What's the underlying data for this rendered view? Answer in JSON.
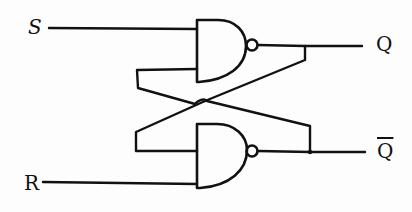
{
  "diagram": {
    "type": "circuit",
    "ink_color": "#111111",
    "background_color": "#fdfdfd",
    "inputs": [
      {
        "id": "S",
        "label": "S"
      },
      {
        "id": "R",
        "label": "R"
      }
    ],
    "outputs": [
      {
        "id": "Q",
        "label": "Q"
      },
      {
        "id": "Qbar",
        "label": "Q"
      }
    ],
    "gates": [
      {
        "id": "nand-top",
        "kind": "NAND",
        "inputs": [
          "S",
          "Qbar"
        ],
        "output": "Q"
      },
      {
        "id": "nand-bottom",
        "kind": "NAND",
        "inputs": [
          "Q",
          "R"
        ],
        "output": "Qbar"
      }
    ],
    "connections": [
      {
        "from": "S",
        "to": "nand-top.in1"
      },
      {
        "from": "nand-bottom.out",
        "to": "nand-top.in2",
        "note": "cross-coupled feedback"
      },
      {
        "from": "nand-top.out",
        "to": "nand-bottom.in1",
        "note": "cross-coupled feedback"
      },
      {
        "from": "R",
        "to": "nand-bottom.in2"
      },
      {
        "from": "nand-top.out",
        "to": "Q"
      },
      {
        "from": "nand-bottom.out",
        "to": "Qbar"
      }
    ]
  }
}
